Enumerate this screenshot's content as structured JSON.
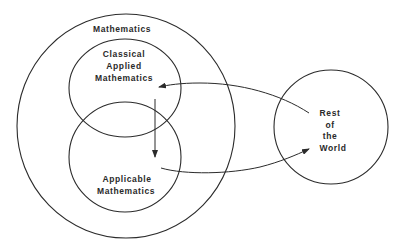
{
  "diagram": {
    "circles": {
      "mathematics": {
        "label": "Mathematics"
      },
      "classical": {
        "lines": [
          "Classical",
          "Applied",
          "Mathematics"
        ]
      },
      "applicable": {
        "lines": [
          "Applicable",
          "Mathematics"
        ]
      },
      "rest": {
        "lines": [
          "Rest",
          "of",
          "the",
          "World"
        ]
      }
    },
    "arrows": [
      {
        "from": "Rest of the World",
        "to": "Classical Applied Mathematics"
      },
      {
        "from": "Classical Applied Mathematics",
        "to": "Applicable Mathematics"
      },
      {
        "from": "Applicable Mathematics",
        "to": "Rest of the World"
      }
    ],
    "colors": {
      "line": "#2b2b2b",
      "text": "#2a2a2a",
      "background": "#ffffff"
    }
  }
}
